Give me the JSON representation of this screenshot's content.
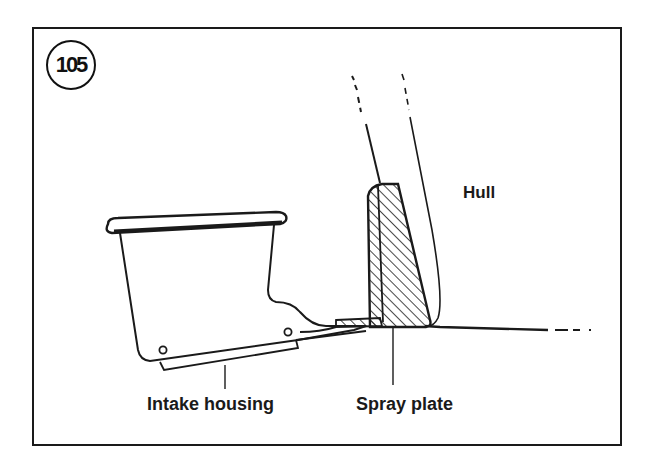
{
  "figure": {
    "number": "105",
    "labels": {
      "hull": "Hull",
      "intake_housing": "Intake housing",
      "spray_plate": "Spray plate"
    }
  },
  "colors": {
    "ink": "#1a1a1a",
    "background": "#ffffff"
  }
}
